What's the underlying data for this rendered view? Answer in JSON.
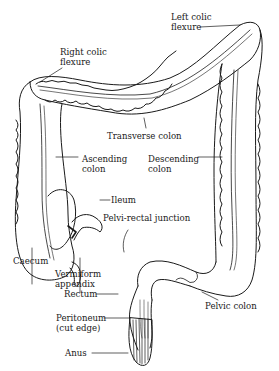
{
  "diagram": {
    "labels": {
      "left_colic_flexure": [
        "Left colic",
        "flexure"
      ],
      "right_colic_flexure": [
        "Right colic",
        "flexure"
      ],
      "transverse_colon": "Transverse colon",
      "ascending_colon": [
        "Ascending",
        "colon"
      ],
      "descending_colon": [
        "Descending",
        "colon"
      ],
      "ileum": "Ileum",
      "pelvi_rectal_junction": "Pelvi-rectal junction",
      "caecum": "Caecum",
      "vermiform_appendix": [
        "Vermiform",
        "appendix"
      ],
      "rectum": "Rectum",
      "peritoneum": [
        "Peritoneum",
        "(cut edge)"
      ],
      "anus": "Anus",
      "pelvic_colon": "Pelvic colon"
    },
    "colors": {
      "ink": "#1a1a1a",
      "background": "#ffffff"
    }
  }
}
